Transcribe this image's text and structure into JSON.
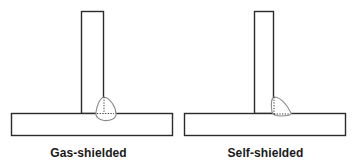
{
  "diagram": {
    "type": "weld joint comparison",
    "colors": {
      "outline": "#2a2a2a",
      "weld": "#8a8a8a",
      "background": "#ffffff"
    },
    "panels": [
      {
        "id": "gas-shielded",
        "caption": "Gas-shielded",
        "joint": "T-joint fillet weld",
        "weld_profile": "deep symmetric penetration"
      },
      {
        "id": "self-shielded",
        "caption": "Self-shielded",
        "joint": "T-joint fillet weld",
        "weld_profile": "shallow penetration, bead offset to side"
      }
    ]
  }
}
